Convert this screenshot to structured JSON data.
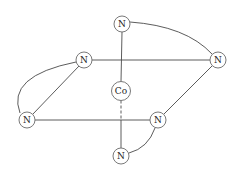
{
  "diagram": {
    "type": "octahedral coordination complex",
    "center_atom": {
      "id": "co",
      "label": "Co",
      "x": 121,
      "y": 91,
      "r": 9.5
    },
    "atoms": [
      {
        "id": "n_top",
        "label": "N",
        "x": 122,
        "y": 24,
        "r": 8
      },
      {
        "id": "n_right",
        "label": "N",
        "x": 218,
        "y": 60,
        "r": 8
      },
      {
        "id": "n_upper_left",
        "label": "N",
        "x": 84,
        "y": 60,
        "r": 8
      },
      {
        "id": "n_lower_left",
        "label": "N",
        "x": 27,
        "y": 120,
        "r": 8
      },
      {
        "id": "n_mid_right",
        "label": "N",
        "x": 158,
        "y": 120,
        "r": 8
      },
      {
        "id": "n_bottom",
        "label": "N",
        "x": 121,
        "y": 156,
        "r": 8
      }
    ],
    "bonds": [
      {
        "from": "n_top",
        "to": "co",
        "style": "solid",
        "type": "axial"
      },
      {
        "from": "co",
        "to": "n_bottom",
        "style": "dashed-then-solid",
        "type": "axial"
      },
      {
        "from": "n_upper_left",
        "to": "n_right",
        "style": "solid",
        "type": "equatorial-edge"
      },
      {
        "from": "n_lower_left",
        "to": "n_mid_right",
        "style": "solid",
        "type": "equatorial-edge"
      },
      {
        "from": "n_upper_left",
        "to": "n_lower_left",
        "style": "solid",
        "type": "equatorial-edge"
      },
      {
        "from": "n_right",
        "to": "n_mid_right",
        "style": "solid",
        "type": "equatorial-edge"
      }
    ],
    "chelate_arcs": [
      {
        "from": "n_top",
        "to": "n_right"
      },
      {
        "from": "n_upper_left",
        "to": "n_lower_left"
      },
      {
        "from": "n_mid_right",
        "to": "n_bottom"
      }
    ]
  }
}
